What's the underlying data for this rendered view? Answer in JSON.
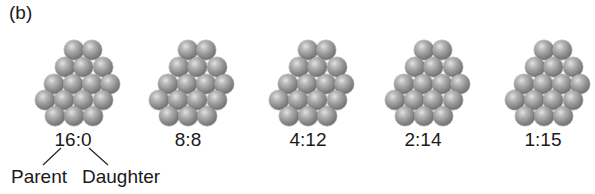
{
  "panel_label": "(b)",
  "clusters": [
    {
      "ratio": "16:0",
      "parent": 16,
      "daughter": 0
    },
    {
      "ratio": "8:8",
      "parent": 8,
      "daughter": 8
    },
    {
      "ratio": "4:12",
      "parent": 4,
      "daughter": 12
    },
    {
      "ratio": "2:14",
      "parent": 2,
      "daughter": 14
    },
    {
      "ratio": "1:15",
      "parent": 1,
      "daughter": 15
    }
  ],
  "annotations": {
    "parent_label": "Parent",
    "daughter_label": "Daughter"
  }
}
